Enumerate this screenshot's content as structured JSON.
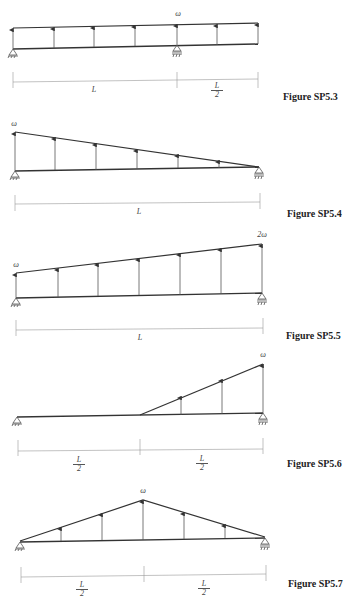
{
  "figures": [
    {
      "id": "fig-sp5-3",
      "caption": "Figure SP5.3",
      "load_label": "ω",
      "dims": [
        {
          "label": "L"
        },
        {
          "num": "L",
          "den": "2"
        }
      ],
      "description": "Overhanging beam, uniform load ω, pin at left, roller at L, overhang L/2"
    },
    {
      "id": "fig-sp5-4",
      "caption": "Figure SP5.4",
      "load_label": "ω",
      "dims": [
        {
          "label": "L"
        }
      ],
      "description": "Simply supported beam, triangular load decreasing from ω at left to 0 at right"
    },
    {
      "id": "fig-sp5-5",
      "caption": "Figure SP5.5",
      "load_label_left": "ω",
      "load_label_right": "2ω",
      "dims": [
        {
          "label": "L"
        }
      ],
      "description": "Simply supported beam, trapezoidal load from ω at left to 2ω at right"
    },
    {
      "id": "fig-sp5-6",
      "caption": "Figure SP5.6",
      "load_label": "ω",
      "dims": [
        {
          "num": "L",
          "den": "2"
        },
        {
          "num": "L",
          "den": "2"
        }
      ],
      "description": "Simply supported beam, triangular load over right half increasing to ω"
    },
    {
      "id": "fig-sp5-7",
      "caption": "Figure SP5.7",
      "load_label": "ω",
      "dims": [
        {
          "num": "L",
          "den": "2"
        },
        {
          "num": "L",
          "den": "2"
        }
      ],
      "description": "Simply supported beam, symmetric triangular load peaking at ω at midspan"
    }
  ]
}
